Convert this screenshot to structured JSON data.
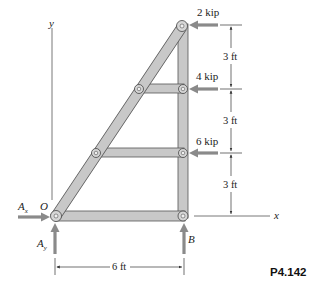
{
  "figure": {
    "label": "P4.142",
    "type": "truss frame free-body diagram"
  },
  "axes": {
    "x_label": "x",
    "y_label": "y",
    "origin_label": "O"
  },
  "loads": [
    {
      "label": "2 kip",
      "direction": "left",
      "joint": "top"
    },
    {
      "label": "4 kip",
      "direction": "left",
      "joint": "upper-middle"
    },
    {
      "label": "6 kip",
      "direction": "left",
      "joint": "lower-middle"
    }
  ],
  "reactions": [
    {
      "label_main": "A",
      "label_sub": "x",
      "direction": "right"
    },
    {
      "label_main": "A",
      "label_sub": "y",
      "direction": "up"
    },
    {
      "label_main": "B",
      "direction": "up"
    }
  ],
  "dimensions": {
    "vertical": [
      "3 ft",
      "3 ft",
      "3 ft"
    ],
    "horizontal": "6 ft"
  },
  "colors": {
    "member_fill": "#c8c8c8",
    "member_stroke": "#555555",
    "force_arrow": "#8a8a8a",
    "text": "#222222"
  }
}
